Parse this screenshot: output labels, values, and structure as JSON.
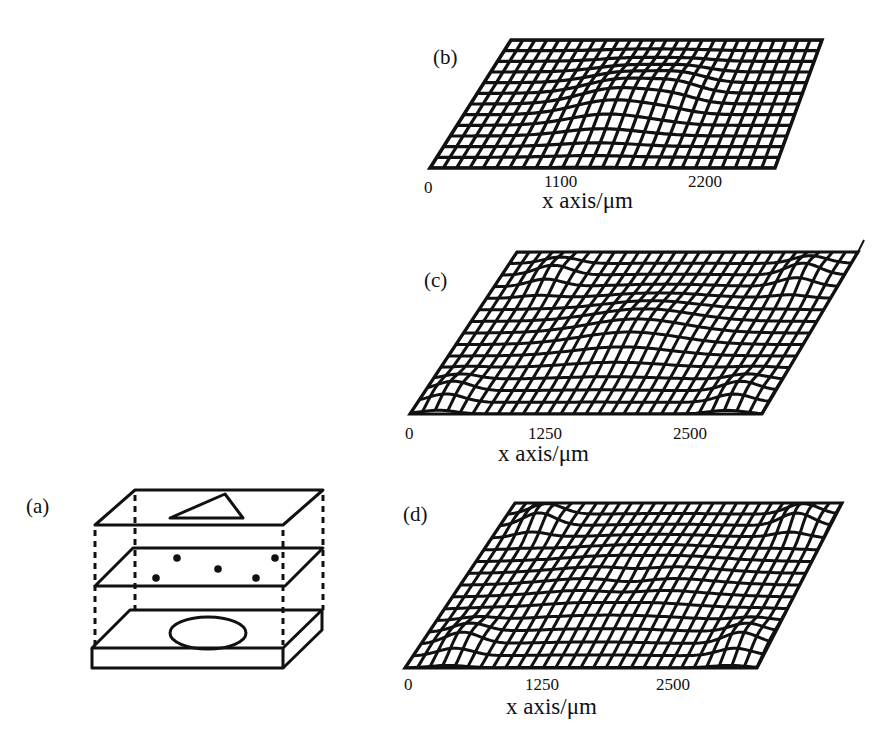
{
  "figure": {
    "panels": [
      {
        "id": "a",
        "label": "(a)",
        "type": "schematic",
        "description": "Three stacked planes connected by dashed lines: top plane with a triangle, middle plane with five dots, bottom slab with an ellipse",
        "layers": [
          {
            "name": "top-plane",
            "shape": "triangle"
          },
          {
            "name": "middle-plane",
            "shape": "dots",
            "count": 5
          },
          {
            "name": "bottom-slab",
            "shape": "ellipse"
          }
        ]
      },
      {
        "id": "b",
        "label": "(b)",
        "type": "surface-mesh",
        "x_ticks": [
          "0",
          "1100",
          "2200"
        ],
        "x_label": "x axis/μm"
      },
      {
        "id": "c",
        "label": "(c)",
        "type": "surface-mesh",
        "x_ticks": [
          "0",
          "1250",
          "2500"
        ],
        "x_label": "x axis/μm"
      },
      {
        "id": "d",
        "label": "(d)",
        "type": "surface-mesh",
        "x_ticks": [
          "0",
          "1250",
          "2500"
        ],
        "x_label": "x axis/μm"
      }
    ],
    "colors": {
      "ink": "#111111",
      "background": "#ffffff"
    }
  },
  "chart_data": [
    {
      "type": "surface",
      "title": "(b)",
      "xlabel": "x axis/μm",
      "x_ticks": [
        0,
        1100,
        2200
      ],
      "xlim": [
        0,
        2400
      ],
      "features": "single central bump with ridge lines; mostly flat mesh elsewhere"
    },
    {
      "type": "surface",
      "title": "(c)",
      "xlabel": "x axis/μm",
      "x_ticks": [
        0,
        1250,
        2500
      ],
      "xlim": [
        0,
        2800
      ],
      "features": "central oval bump plus corner bumps at front-left, front-right and back-right"
    },
    {
      "type": "surface",
      "title": "(d)",
      "xlabel": "x axis/μm",
      "x_ticks": [
        0,
        1250,
        2500
      ],
      "xlim": [
        0,
        2800
      ],
      "features": "large central oval ring with bumps at back-left, back-right, front-left, front-right corners"
    }
  ]
}
